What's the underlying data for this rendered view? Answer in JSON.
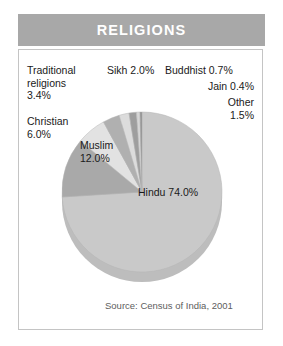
{
  "title": "RELIGIONS",
  "source_note": "Source: Census of India, 2001",
  "labels": {
    "traditional": "Traditional\nreligions\n3.4%",
    "sikh": "Sikh 2.0%",
    "buddhist": "Buddhist 0.7%",
    "jain": "Jain 0.4%",
    "other": "Other\n1.5%",
    "christian": "Christian\n6.0%",
    "muslim": "Muslim\n12.0%",
    "hindu": "Hindu 74.0%"
  },
  "colors": {
    "banner_bg": "#a8a8a8",
    "banner_text": "#ffffff",
    "card_border": "#c4c4c4",
    "background": "#ffffff",
    "label_text": "#1a1a1a",
    "source_text": "#5d5d5d",
    "pie_edge": "#b4b4b4"
  },
  "chart_data": {
    "type": "pie",
    "title": "RELIGIONS",
    "source": "Source: Census of India, 2001",
    "unit": "percent",
    "legend": "none",
    "labels_position": "callout-and-inside",
    "start_angle_deg": -90,
    "direction": "clockwise",
    "categories": [
      "Hindu",
      "Muslim",
      "Christian",
      "Traditional religions",
      "Sikh",
      "Other",
      "Buddhist",
      "Jain"
    ],
    "values": [
      74.0,
      12.0,
      6.0,
      3.4,
      2.0,
      1.5,
      0.7,
      0.4
    ],
    "slices": [
      {
        "name": "Hindu",
        "value": 74.0,
        "color": "#c9c9c9",
        "label": "Hindu 74.0%"
      },
      {
        "name": "Muslim",
        "value": 12.0,
        "color": "#a9a9a9",
        "label": "Muslim 12.0%"
      },
      {
        "name": "Christian",
        "value": 6.0,
        "color": "#e2e2e2",
        "label": "Christian 6.0%"
      },
      {
        "name": "Traditional religions",
        "value": 3.4,
        "color": "#b0b0b0",
        "label": "Traditional religions 3.4%"
      },
      {
        "name": "Sikh",
        "value": 2.0,
        "color": "#dcdcdc",
        "label": "Sikh 2.0%"
      },
      {
        "name": "Other",
        "value": 1.5,
        "color": "#9e9e9e",
        "label": "Other 1.5%"
      },
      {
        "name": "Buddhist",
        "value": 0.7,
        "color": "#d6d6d6",
        "label": "Buddhist 0.7%"
      },
      {
        "name": "Jain",
        "value": 0.4,
        "color": "#8f8f8f",
        "label": "Jain 0.4%"
      }
    ],
    "geometry": {
      "center_x": 142,
      "center_y": 192,
      "radius_x": 80,
      "radius_y": 80,
      "depth": 10,
      "shadow_color": "#bdbdbd"
    }
  }
}
